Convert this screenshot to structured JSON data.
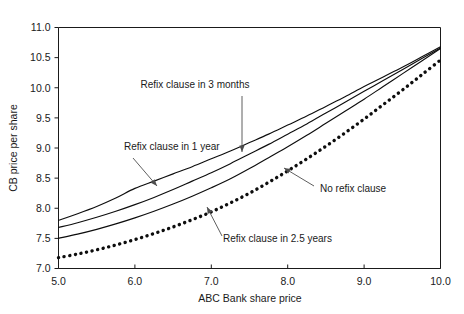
{
  "chart_data": {
    "type": "line",
    "title": "",
    "xlabel": "ABC Bank share price",
    "ylabel": "CB price per share",
    "xlim": [
      5.0,
      10.0
    ],
    "ylim": [
      7.0,
      11.0
    ],
    "xticks": [
      "5.0",
      "6.0",
      "7.0",
      "8.0",
      "9.0",
      "10.0"
    ],
    "yticks": [
      "7.0",
      "7.5",
      "8.0",
      "8.5",
      "9.0",
      "9.5",
      "10.0",
      "10.5",
      "11.0"
    ],
    "grid": false,
    "legend_position": "none (inline annotations with leader lines)",
    "x": [
      5.0,
      5.25,
      5.5,
      5.75,
      6.0,
      6.25,
      6.5,
      6.75,
      7.0,
      7.25,
      7.5,
      7.75,
      8.0,
      8.25,
      8.5,
      8.75,
      9.0,
      9.25,
      9.5,
      9.75,
      10.0
    ],
    "series": [
      {
        "name": "Refix clause in 3 months",
        "style": "solid",
        "values": [
          7.8,
          7.91,
          8.03,
          8.17,
          8.33,
          8.45,
          8.57,
          8.69,
          8.82,
          8.95,
          9.09,
          9.23,
          9.38,
          9.53,
          9.69,
          9.85,
          10.02,
          10.18,
          10.34,
          10.51,
          10.68
        ]
      },
      {
        "name": "Refix clause in 1 year",
        "style": "solid",
        "values": [
          7.68,
          7.76,
          7.85,
          7.95,
          8.06,
          8.18,
          8.31,
          8.45,
          8.59,
          8.74,
          8.9,
          9.06,
          9.23,
          9.4,
          9.58,
          9.76,
          9.94,
          10.12,
          10.3,
          10.48,
          10.66
        ]
      },
      {
        "name": "Refix clause in 2.5 years",
        "style": "solid",
        "values": [
          7.5,
          7.57,
          7.65,
          7.74,
          7.84,
          7.95,
          8.07,
          8.2,
          8.34,
          8.49,
          8.66,
          8.84,
          9.02,
          9.21,
          9.41,
          9.61,
          9.81,
          10.02,
          10.23,
          10.44,
          10.65
        ]
      },
      {
        "name": "No refix clause",
        "style": "dotted",
        "values": [
          7.18,
          7.24,
          7.31,
          7.39,
          7.48,
          7.58,
          7.69,
          7.81,
          7.94,
          8.09,
          8.25,
          8.43,
          8.62,
          8.82,
          9.03,
          9.25,
          9.48,
          9.72,
          9.96,
          10.21,
          10.46
        ]
      }
    ],
    "annotations": [
      {
        "text": "Refix clause in 3 months",
        "label_x": 195,
        "label_y": 88
      },
      {
        "text": "Refix clause in 1 year",
        "label_x": 124,
        "label_y": 150
      },
      {
        "text": "Refix clause in 2.5 years",
        "label_x": 223,
        "label_y": 242
      },
      {
        "text": "No refix clause",
        "label_x": 320,
        "label_y": 192
      }
    ]
  },
  "colors": {
    "ink": "#1a1a1a",
    "series": "#0d0d0d",
    "leader": "#4d4d4d",
    "background": "#ffffff"
  }
}
